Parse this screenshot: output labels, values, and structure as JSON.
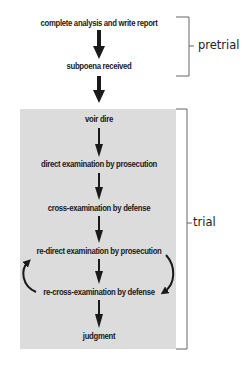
{
  "diagram": {
    "pretrial_steps": [
      "complete analysis and write report",
      "subpoena received"
    ],
    "trial_steps": [
      "voir dire",
      "direct examination by prosecution",
      "cross-examination by defense",
      "re-direct examination by prosecution",
      "re-cross-examination by defense",
      "judgment"
    ],
    "phase_labels": {
      "pretrial": "pretrial",
      "trial": "trial"
    },
    "colors": {
      "trial_background": "#dcdcdc",
      "arrow": "#1a1a1a",
      "bracket": "#666666"
    }
  }
}
